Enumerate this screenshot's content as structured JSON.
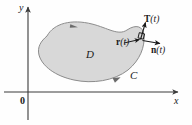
{
  "figure": {
    "background_color": "#fefefe",
    "axis_color": "#3a3a3a",
    "region_fill_color": "#d6d6d6",
    "region_stroke_color": "#8c8c8c",
    "vector_color": "#1a1a1a"
  },
  "axes": {
    "y_label": "y",
    "x_label": "x",
    "origin_label": "0"
  },
  "labels": {
    "region": "D",
    "curve": "C",
    "tangent_bold": "T",
    "tangent_arg": "(t)",
    "position_bold": "r",
    "position_arg": "(t)",
    "normal_bold": "n",
    "normal_arg": "(t)"
  }
}
